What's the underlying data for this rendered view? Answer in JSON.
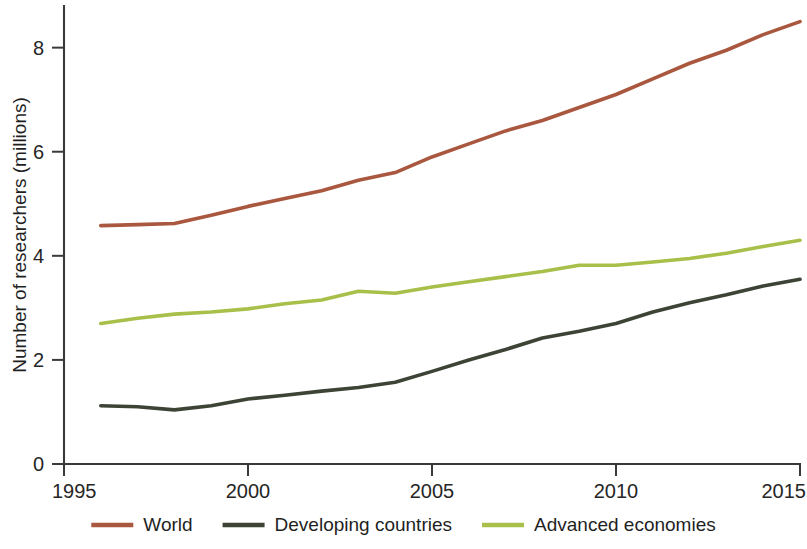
{
  "chart_data": {
    "type": "line",
    "title": "",
    "xlabel": "",
    "ylabel": "Number of researchers (millions)",
    "xlim": [
      1995,
      2015
    ],
    "ylim": [
      0,
      8.8
    ],
    "grid": false,
    "legend_position": "bottom",
    "x_ticks": [
      "1995",
      "2000",
      "2005",
      "2010",
      "2015"
    ],
    "y_ticks": [
      "0",
      "2",
      "4",
      "6",
      "8"
    ],
    "x": [
      1996,
      1997,
      1998,
      1999,
      2000,
      2001,
      2002,
      2003,
      2004,
      2005,
      2006,
      2007,
      2008,
      2009,
      2010,
      2011,
      2012,
      2013,
      2014,
      2015
    ],
    "series": [
      {
        "name": "World",
        "color": "#a9573f",
        "values": [
          4.58,
          4.6,
          4.62,
          4.78,
          4.95,
          5.1,
          5.25,
          5.45,
          5.6,
          5.9,
          6.15,
          6.4,
          6.6,
          6.85,
          7.1,
          7.4,
          7.7,
          7.95,
          8.25,
          8.5
        ]
      },
      {
        "name": "Developing countries",
        "color": "#3d4436",
        "values": [
          1.12,
          1.1,
          1.04,
          1.12,
          1.25,
          1.32,
          1.4,
          1.47,
          1.57,
          1.78,
          2.0,
          2.2,
          2.42,
          2.55,
          2.7,
          2.92,
          3.1,
          3.25,
          3.42,
          3.55
        ]
      },
      {
        "name": "Advanced economies",
        "color": "#a8c04a",
        "values": [
          2.7,
          2.8,
          2.88,
          2.92,
          2.98,
          3.08,
          3.15,
          3.32,
          3.28,
          3.4,
          3.5,
          3.6,
          3.7,
          3.82,
          3.82,
          3.88,
          3.95,
          4.05,
          4.18,
          4.3
        ]
      }
    ]
  },
  "legend": {
    "items": [
      {
        "label": "World",
        "color": "#a9573f"
      },
      {
        "label": "Developing countries",
        "color": "#3d4436"
      },
      {
        "label": "Advanced economies",
        "color": "#a8c04a"
      }
    ]
  }
}
